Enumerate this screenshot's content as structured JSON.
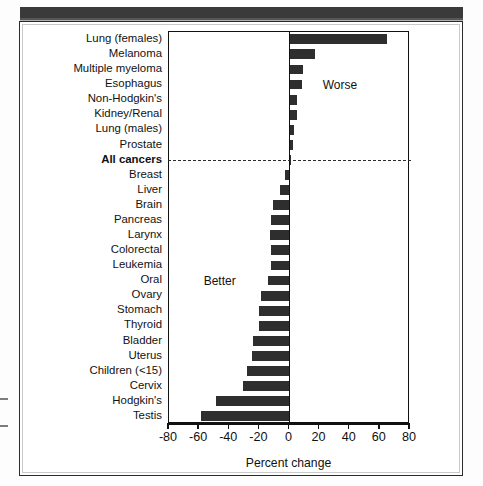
{
  "figure": {
    "axis_title": "Percent change",
    "annotation_worse": "Worse",
    "annotation_better": "Better",
    "highlight_category": "All cancers"
  },
  "chart_data": {
    "type": "bar",
    "orientation": "horizontal",
    "title": "",
    "xlabel": "Percent change",
    "ylabel": "",
    "xlim": [
      -80,
      80
    ],
    "xticks": [
      -80,
      -60,
      -40,
      -20,
      0,
      20,
      40,
      60,
      80
    ],
    "xticklabels": [
      "-80",
      "-60",
      "-40",
      "-20",
      "0",
      "20",
      "40",
      "60",
      "80"
    ],
    "grid": false,
    "legend": null,
    "reference_line": {
      "category": "All cancers",
      "style": "dashed",
      "orientation": "horizontal"
    },
    "annotations": [
      {
        "text": "Worse",
        "region": "positive"
      },
      {
        "text": "Better",
        "region": "negative"
      }
    ],
    "bar_color": "#2e2e2e",
    "categories": [
      "Lung (females)",
      "Melanoma",
      "Multiple myeloma",
      "Esophagus",
      "Non-Hodgkin's",
      "Kidney/Renal",
      "Lung (males)",
      "Prostate",
      "All cancers",
      "Breast",
      "Liver",
      "Brain",
      "Pancreas",
      "Larynx",
      "Colorectal",
      "Leukemia",
      "Oral",
      "Ovary",
      "Stomach",
      "Thyroid",
      "Bladder",
      "Uterus",
      "Children (<15)",
      "Cervix",
      "Hodgkin's",
      "Testis"
    ],
    "values": [
      65,
      17,
      9,
      8,
      5,
      5,
      3,
      2,
      1,
      -3,
      -6,
      -11,
      -12,
      -13,
      -12,
      -12,
      -14,
      -19,
      -20,
      -20,
      -24,
      -25,
      -28,
      -31,
      -49,
      -59
    ]
  }
}
